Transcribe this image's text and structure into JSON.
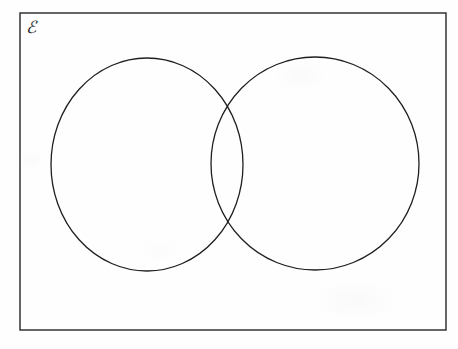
{
  "document": {
    "type": "venn-diagram",
    "title": "Blank two-set Venn diagram",
    "description": "An empty two-circle Venn diagram drawn inside a rectangle representing the universal set.",
    "background_color": "#fefefe",
    "stroke_color": "#1f1f1f"
  },
  "universal_set": {
    "label": "ℰ",
    "label_name": "script-capital-e",
    "meaning": "universal set",
    "rectangle": {
      "x": 20,
      "y": 13,
      "width": 426,
      "height": 317,
      "stroke_width": 1.4,
      "stroke_color": "#262626",
      "fill": "none"
    }
  },
  "sets": [
    {
      "id": "set-a",
      "label": "",
      "position": "left",
      "cx": 147,
      "cy": 164.5,
      "rx": 96,
      "ry": 106.5,
      "stroke_width": 1.3,
      "stroke_color": "#1f1f1f",
      "fill": "none"
    },
    {
      "id": "set-b",
      "label": "",
      "position": "right",
      "cx": 315,
      "cy": 163.5,
      "rx": 104,
      "ry": 106.5,
      "stroke_width": 1.3,
      "stroke_color": "#1f1f1f",
      "fill": "none"
    }
  ],
  "intersection": {
    "upper_point": {
      "x": 234,
      "y": 97
    },
    "lower_point": {
      "x": 234,
      "y": 238
    },
    "label": "",
    "contents": []
  },
  "regions": {
    "left_only": {
      "label": "",
      "contents": []
    },
    "right_only": {
      "label": "",
      "contents": []
    },
    "both": {
      "label": "",
      "contents": []
    },
    "neither": {
      "label": "",
      "contents": []
    }
  },
  "annotations": []
}
